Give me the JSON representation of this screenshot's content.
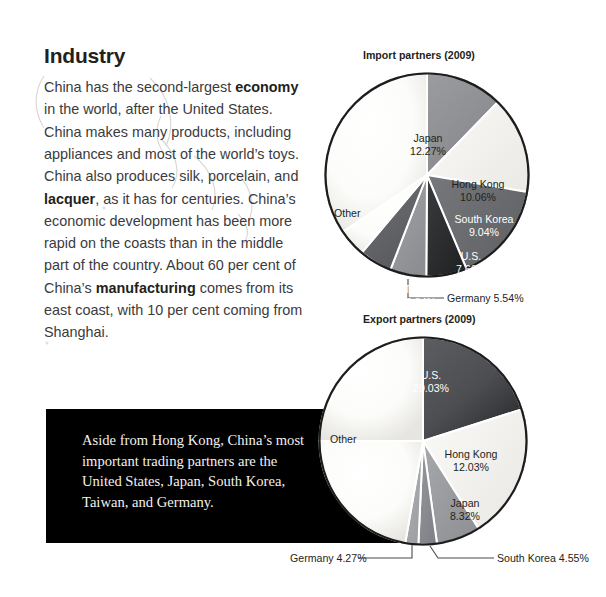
{
  "article": {
    "title": "Industry",
    "paragraph_runs": [
      {
        "text": "China has the second-largest ",
        "bold": false
      },
      {
        "text": "economy",
        "bold": true
      },
      {
        "text": " in the world, after the United States. China makes many products, including appliances and most of the world’s toys. China also produces silk, porcelain, and ",
        "bold": false
      },
      {
        "text": "lacquer",
        "bold": true
      },
      {
        "text": ", as it has for centuries. China’s economic development has been more rapid on the coasts than in the middle part of the country. About 60 per cent of China’s ",
        "bold": false
      },
      {
        "text": "manufacturing",
        "bold": true
      },
      {
        "text": " comes from its east coast, with 10 per cent coming from Shanghai.",
        "bold": false
      }
    ]
  },
  "callout_box": {
    "background_color": "#000000",
    "text_color": "#f2f0ee",
    "text": "Aside from Hong Kong, China’s most important trading partners are the United States, Japan, South Korea, Taiwan, and Germany."
  },
  "chart_data": [
    {
      "id": "import",
      "type": "pie",
      "title": "Import partners (2009)",
      "unit": "%",
      "start_angle_deg": 0,
      "direction": "clockwise",
      "categories": [
        "Japan",
        "Hong Kong",
        "South Korea",
        "U.S.",
        "Taiwan",
        "Germany",
        "Other"
      ],
      "values": [
        12.27,
        10.06,
        9.04,
        7.66,
        6.84,
        5.54,
        48.59
      ],
      "labels": [
        "12.27%",
        "10.06%",
        "9.04%",
        "7.66%",
        "6.84%",
        "5.54%",
        ""
      ],
      "colors": [
        "#8e9094",
        "#f4f4f2",
        "#6d6f73",
        "#2f3133",
        "#97999d",
        "#636569",
        "#fbfbf9"
      ],
      "label_placement": [
        "inside",
        "inside",
        "inside",
        "inside",
        "inside",
        "callout",
        "inside"
      ],
      "callouts": [
        {
          "category": "Germany",
          "text": "Germany 5.54%"
        }
      ],
      "legend": "none",
      "grid": false
    },
    {
      "id": "export",
      "type": "pie",
      "title": "Export partners (2009)",
      "unit": "%",
      "start_angle_deg": 0,
      "direction": "clockwise",
      "categories": [
        "U.S.",
        "Hong Kong",
        "Japan",
        "South Korea",
        "Germany",
        "Other"
      ],
      "values": [
        20.03,
        12.03,
        8.32,
        4.55,
        4.27,
        50.8
      ],
      "labels": [
        "20.03%",
        "12.03%",
        "8.32%",
        "4.55%",
        "4.27%",
        ""
      ],
      "colors": [
        "#4a4c50",
        "#f4f4f2",
        "#9b9da1",
        "#8a8c90",
        "#a9abaf",
        "#fbfbf9"
      ],
      "label_placement": [
        "inside",
        "inside",
        "inside",
        "callout",
        "callout",
        "inside"
      ],
      "callouts": [
        {
          "category": "South Korea",
          "text": "South Korea 4.55%"
        },
        {
          "category": "Germany",
          "text": "Germany 4.27%"
        }
      ],
      "legend": "none",
      "grid": false
    }
  ],
  "import_chart_labels": {
    "japan_name": "Japan",
    "japan_pct": "12.27%",
    "hongkong_name": "Hong Kong",
    "hongkong_pct": "10.06%",
    "southkorea_name": "South Korea",
    "southkorea_pct": "9.04%",
    "us_name": "U.S.",
    "us_pct": "7.66%",
    "taiwan_name": "Taiwan",
    "taiwan_pct": "6.84%",
    "other_name": "Other",
    "germany_callout": "Germany 5.54%"
  },
  "export_chart_labels": {
    "us_name": "U.S.",
    "us_pct": "20.03%",
    "hongkong_name": "Hong Kong",
    "hongkong_pct": "12.03%",
    "japan_name": "Japan",
    "japan_pct": "8.32%",
    "other_name": "Other",
    "southkorea_callout": "South Korea 4.55%",
    "germany_callout": "Germany 4.27%"
  }
}
